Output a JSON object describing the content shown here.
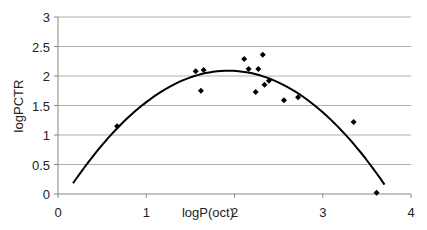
{
  "chart_data": {
    "type": "scatter",
    "title": "",
    "xlabel": "logP(oct)",
    "ylabel": "logPCTR",
    "xlim": [
      0,
      4
    ],
    "ylim": [
      0,
      3
    ],
    "x_ticks": [
      "0",
      "1",
      "2",
      "3",
      "4"
    ],
    "y_ticks": [
      "0",
      "0.5",
      "1",
      "1.5",
      "2",
      "2.5",
      "3"
    ],
    "grid": {
      "horizontal": true,
      "vertical": false
    },
    "legend": null,
    "series": [
      {
        "name": "observed",
        "type": "scatter",
        "marker": "diamond",
        "x": [
          0.67,
          1.56,
          1.65,
          1.62,
          2.11,
          2.32,
          2.16,
          2.27,
          2.24,
          2.34,
          2.39,
          2.56,
          2.72,
          3.35,
          3.61
        ],
        "y": [
          1.15,
          2.08,
          2.1,
          1.75,
          2.29,
          2.36,
          2.12,
          2.12,
          1.73,
          1.85,
          1.92,
          1.59,
          1.64,
          1.22,
          0.02
        ]
      },
      {
        "name": "quadratic fit",
        "type": "line",
        "equation": "y = -0.616*(x-1.93)^2 + 2.09",
        "x_range": [
          0.17,
          3.7
        ]
      }
    ]
  },
  "axes": {
    "xlabel": "logP(oct)",
    "ylabel": "logPCTR"
  }
}
